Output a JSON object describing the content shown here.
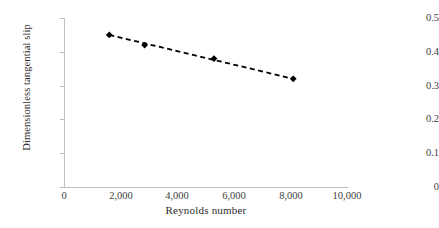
{
  "chart_data": {
    "type": "scatter",
    "title": "",
    "subtitle": "",
    "xlabel": "Reynolds number",
    "ylabel": "Dimensionless tangential slip",
    "xlim": [
      0,
      10000
    ],
    "ylim": [
      0,
      0.5
    ],
    "grid": false,
    "legend": null,
    "x_ticks": [
      0,
      2000,
      4000,
      6000,
      8000,
      10000
    ],
    "x_tick_labels": [
      "0",
      "2,000",
      "4,000",
      "6,000",
      "8,000",
      "10,000"
    ],
    "y_ticks": [
      0,
      0.1,
      0.2,
      0.3,
      0.4,
      0.5
    ],
    "y_tick_labels": [
      "0",
      "0.1",
      "0.2",
      "0.3",
      "0.4",
      "0.5"
    ],
    "marker": "diamond",
    "marker_color": "#000000",
    "line_style": "dashed",
    "line_color": "#000000",
    "x": [
      1600,
      2850,
      5300,
      8100
    ],
    "y": [
      0.45,
      0.42,
      0.38,
      0.32
    ],
    "series": [
      {
        "name": "Dimensionless tangential slip",
        "points": [
          {
            "x": 1600,
            "y": 0.45
          },
          {
            "x": 2850,
            "y": 0.42
          },
          {
            "x": 5300,
            "y": 0.38
          },
          {
            "x": 8100,
            "y": 0.32
          }
        ]
      }
    ],
    "trendline": {
      "style": "dashed",
      "color": "#000000",
      "from": {
        "x": 1600,
        "y": 0.45
      },
      "to": {
        "x": 8100,
        "y": 0.32
      }
    },
    "annotations": []
  },
  "axes": {
    "x_title": "Reynolds number",
    "y_title": "Dimensionless tangential slip"
  },
  "colors": {
    "axis": "#bfbfbf",
    "tick_text": "#404040",
    "title_text": "#2b2b2b",
    "series": "#000000",
    "background": "#ffffff"
  }
}
